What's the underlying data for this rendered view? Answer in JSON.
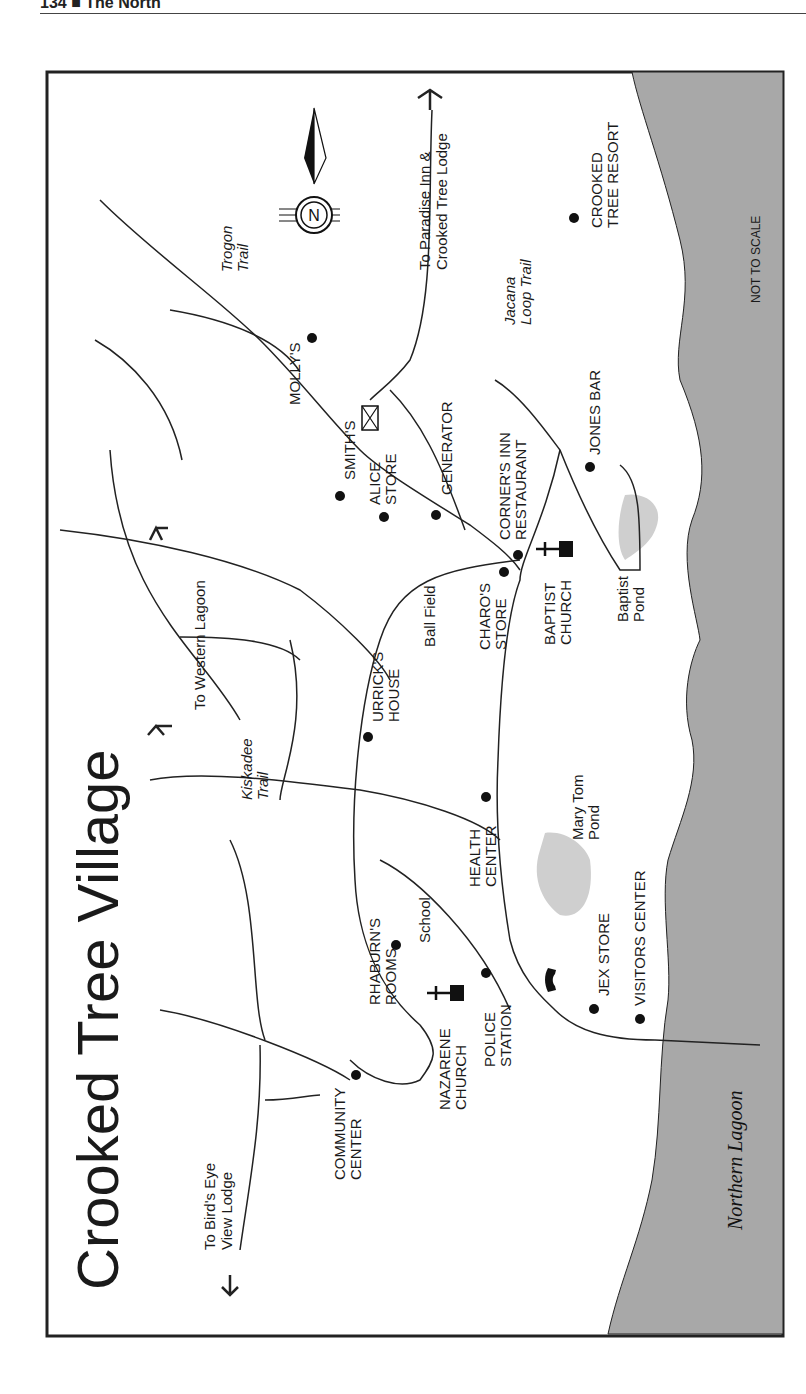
{
  "page_header": {
    "text": "134 ■ The North"
  },
  "map": {
    "title": "Crooked Tree Village",
    "orientation_note": "NOT TO SCALE",
    "compass": {
      "letter": "N"
    },
    "water": {
      "label": "Northern Lagoon",
      "color": "#a8a8a8"
    },
    "ponds": [
      {
        "label": "Mary Tom Pond",
        "color": "#cfcfcf"
      },
      {
        "label": "Baptist Pond",
        "color": "#cfcfcf"
      }
    ],
    "directions": [
      {
        "text": "To Paradise Inn & Crooked Tree Lodge"
      },
      {
        "text": "To Western Lagoon"
      },
      {
        "text": "To Bird's Eye View Lodge"
      }
    ],
    "trails": [
      {
        "text": "Trogon Trail"
      },
      {
        "text": "Jacana Loop Trail"
      },
      {
        "text": "Kiskadee Trail"
      }
    ],
    "places": [
      {
        "text": "MOLLY'S"
      },
      {
        "text": "SMITH'S"
      },
      {
        "text": "ALICE STORE"
      },
      {
        "text": "GENERATOR"
      },
      {
        "text": "CORNER'S INN RESTAURANT"
      },
      {
        "text": "JONES BAR"
      },
      {
        "text": "CROOKED TREE RESORT"
      },
      {
        "text": "CHARO'S STORE"
      },
      {
        "text": "BAPTIST CHURCH"
      },
      {
        "text": "Ball Field"
      },
      {
        "text": "URRICK'S HOUSE"
      },
      {
        "text": "HEALTH CENTER"
      },
      {
        "text": "RHABURN'S ROOMS"
      },
      {
        "text": "School"
      },
      {
        "text": "NAZARENE CHURCH"
      },
      {
        "text": "POLICE STATION"
      },
      {
        "text": "JEX STORE"
      },
      {
        "text": "VISITORS CENTER"
      },
      {
        "text": "COMMUNITY CENTER"
      }
    ]
  }
}
